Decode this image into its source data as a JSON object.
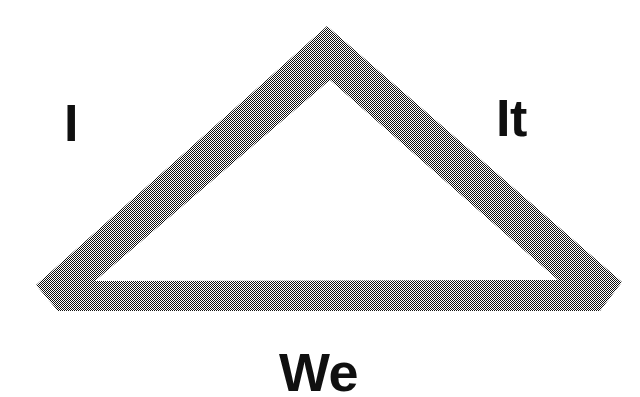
{
  "diagram": {
    "shape": {
      "name": "hollow-triangle",
      "type": "triangle-outline",
      "fill_pattern": "dithered-halftone-checkerboard",
      "fill_color": "#7d7d7d",
      "background_color": "#ffffff",
      "outer_points": "327,26 622,282 600,311 58,311 36,285",
      "inner_points": "330,80 558,280 95,281",
      "stroke_thickness_px": 29
    },
    "labels": [
      {
        "id": "i",
        "text": "I",
        "position": "upper-left",
        "x": 66,
        "y": 100,
        "font_size_px": 52,
        "color": "#101010"
      },
      {
        "id": "it",
        "text": "It",
        "position": "upper-right",
        "x": 499,
        "y": 95,
        "font_size_px": 52,
        "color": "#101010"
      },
      {
        "id": "we",
        "text": "We",
        "position": "bottom-center",
        "x": 282,
        "y": 350,
        "font_size_px": 54,
        "color": "#101010"
      }
    ]
  }
}
